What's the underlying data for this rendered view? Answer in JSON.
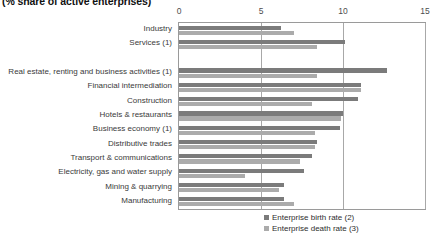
{
  "title": "(% share of active enterprises)",
  "legend": [
    {
      "label": "Enterprise birth rate (2)",
      "color": "#7b7b7b",
      "swatch": "legend-swatch-birth"
    },
    {
      "label": "Enterprise death rate (3)",
      "color": "#ababab",
      "swatch": "legend-swatch-death"
    }
  ],
  "axis": {
    "ticks": [
      "0",
      "5",
      "10",
      "15"
    ],
    "tick_values": [
      0,
      5,
      10,
      15
    ],
    "min": 0,
    "max": 15
  },
  "chart_data": {
    "type": "bar",
    "orientation": "horizontal",
    "title": "(% share of active enterprises)",
    "xlabel": "",
    "ylabel": "",
    "xlim": [
      0,
      15
    ],
    "grid": true,
    "legend_position": "bottom-right",
    "categories": [
      "Industry",
      "Services (1)",
      "",
      "Real estate, renting and business activities (1)",
      "Financial intermediation",
      "Construction",
      "Hotels & restaurants",
      "Business economy (1)",
      "Distributive trades",
      "Transport & communications",
      "Electricity, gas and water supply",
      "Mining & quarrying",
      "Manufacturing"
    ],
    "series": [
      {
        "name": "Enterprise birth rate (2)",
        "color": "#7b7b7b",
        "values": [
          6.2,
          10.1,
          null,
          12.7,
          11.1,
          10.9,
          10.0,
          9.8,
          8.4,
          8.1,
          7.6,
          6.4,
          6.4
        ]
      },
      {
        "name": "Enterprise death rate (3)",
        "color": "#ababab",
        "values": [
          7.0,
          8.4,
          null,
          8.4,
          11.1,
          8.1,
          9.9,
          8.3,
          8.3,
          7.4,
          4.0,
          6.1,
          7.0
        ]
      }
    ]
  }
}
